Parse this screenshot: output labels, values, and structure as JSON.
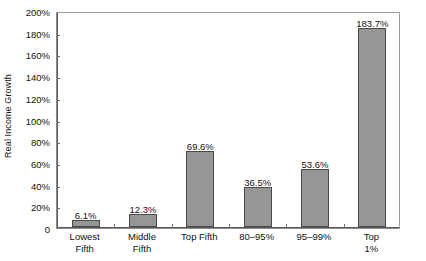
{
  "chart_data": {
    "type": "bar",
    "title": "",
    "xlabel": "",
    "ylabel": "Real Income Growth",
    "categories": [
      "Lowest\nFifth",
      "Middle\nFifth",
      "Top Fifth",
      "80–95%",
      "95–99%",
      "Top 1%"
    ],
    "values": [
      6.1,
      12.3,
      69.6,
      36.5,
      53.6,
      183.7
    ],
    "value_labels": [
      "6.1%",
      "12.3%",
      "69.6%",
      "36.5%",
      "53.6%",
      "183.7%"
    ],
    "ylim": [
      0,
      200
    ],
    "ytick_values": [
      0,
      20,
      40,
      60,
      80,
      100,
      120,
      140,
      160,
      180,
      200
    ],
    "ytick_labels": [
      "0",
      "20%",
      "40%",
      "60%",
      "80%",
      "100%",
      "120%",
      "140%",
      "160%",
      "180%",
      "200%"
    ],
    "grid": false,
    "legend": false,
    "bar_color": "#969696",
    "bar_edge_color": "#4a4a4a",
    "axis_color": "#5a5a5a",
    "text_color": "#111111",
    "background": "#ffffff"
  }
}
